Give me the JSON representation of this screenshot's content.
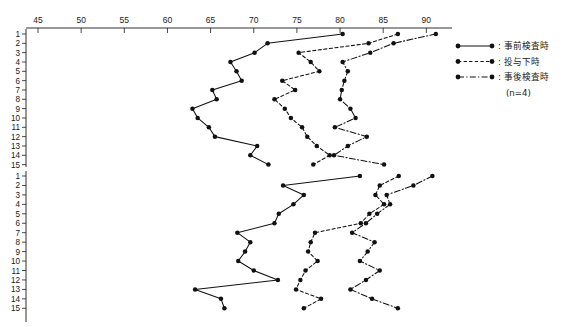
{
  "chart_data": {
    "type": "line",
    "title": "",
    "xlabel": "",
    "ylabel": "",
    "xlim": [
      43,
      92
    ],
    "ylim_rows": [
      1,
      15
    ],
    "grid": false,
    "orientation": "horizontal-rows",
    "legend_position": "right",
    "xticks": [
      45,
      50,
      55,
      60,
      65,
      70,
      75,
      80,
      85,
      90
    ],
    "row_labels": [
      1,
      2,
      3,
      4,
      5,
      6,
      7,
      8,
      9,
      10,
      11,
      12,
      13,
      14,
      15
    ],
    "legend": [
      {
        "label": ": 事前検査時",
        "style": "solid",
        "marker": "filled-circle"
      },
      {
        "label": ": 投与下時",
        "style": "dashed",
        "marker": "filled-circle"
      },
      {
        "label": ": 事後検査時",
        "style": "dashdot",
        "marker": "filled-circle"
      }
    ],
    "legend_note": "(n=4)",
    "panels": [
      {
        "name": "upper-panel",
        "series": [
          {
            "name": "事前検査時",
            "style": "solid",
            "rows": [
              1,
              2,
              3,
              4,
              5,
              6,
              7,
              8,
              9,
              10,
              11,
              12,
              13,
              14,
              15
            ],
            "values": [
              80.3,
              71.6,
              70.1,
              67.3,
              68.0,
              68.6,
              65.2,
              65.7,
              62.9,
              63.5,
              64.8,
              65.5,
              70.4,
              69.6,
              71.7
            ]
          },
          {
            "name": "投与下時",
            "style": "dashed",
            "rows": [
              1,
              2,
              3,
              4,
              5,
              6,
              7,
              8,
              9,
              10,
              11,
              12,
              13,
              14,
              15
            ],
            "values": [
              86.7,
              83.3,
              75.2,
              76.6,
              77.6,
              73.3,
              74.8,
              72.4,
              73.6,
              74.3,
              75.6,
              76.2,
              77.3,
              78.8,
              76.9
            ]
          },
          {
            "name": "事後検査時",
            "style": "dashdot",
            "rows": [
              1,
              2,
              3,
              4,
              5,
              6,
              7,
              8,
              9,
              10,
              11,
              12,
              13,
              14,
              15
            ],
            "values": [
              91.1,
              86.2,
              83.5,
              80.3,
              80.9,
              80.5,
              80.2,
              80.0,
              81.2,
              81.8,
              79.4,
              83.1,
              80.9,
              79.3,
              85.1
            ]
          }
        ]
      },
      {
        "name": "lower-panel",
        "series": [
          {
            "name": "事前検査時",
            "style": "solid",
            "rows": [
              1,
              2,
              3,
              4,
              5,
              6,
              7,
              8,
              9,
              10,
              11,
              12,
              13,
              14,
              15
            ],
            "values": [
              82.3,
              73.4,
              75.8,
              74.6,
              72.9,
              72.4,
              68.1,
              69.6,
              69.0,
              68.2,
              70.0,
              72.8,
              63.2,
              66.2,
              66.6
            ]
          },
          {
            "name": "投与下時",
            "style": "dashed",
            "rows": [
              1,
              2,
              3,
              4,
              5,
              6,
              7,
              8,
              9,
              10,
              11,
              12,
              13,
              14,
              15
            ],
            "values": [
              86.8,
              84.6,
              84.1,
              85.1,
              83.4,
              82.4,
              77.1,
              76.6,
              76.3,
              77.4,
              76.0,
              75.4,
              74.9,
              77.8,
              75.8
            ]
          },
          {
            "name": "事後検査時",
            "style": "dashdot",
            "rows": [
              1,
              2,
              3,
              4,
              5,
              6,
              7,
              8,
              9,
              10,
              11,
              12,
              13,
              14,
              15
            ],
            "values": [
              90.7,
              88.5,
              85.4,
              85.8,
              84.3,
              83.0,
              81.4,
              84.0,
              83.2,
              82.3,
              84.6,
              83.0,
              81.2,
              83.7,
              86.7
            ]
          }
        ]
      }
    ]
  }
}
